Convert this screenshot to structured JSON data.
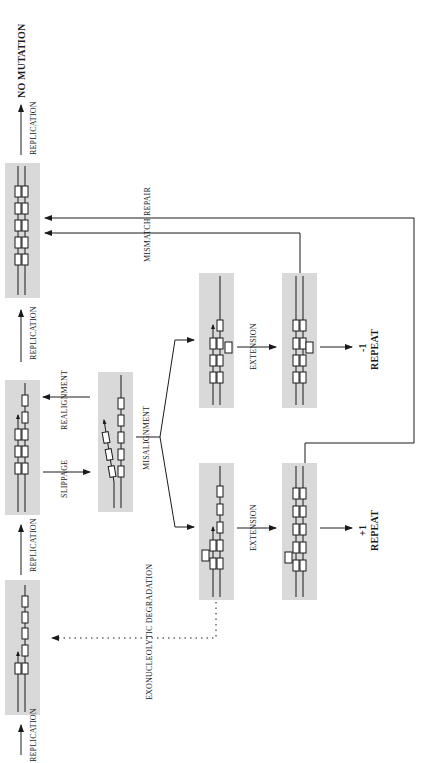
{
  "diagram": {
    "orientation": "rotated-90-ccw",
    "colors": {
      "panel_bg": "#d9d9d9",
      "line": "#1a1a1a",
      "box_fill": "#ffffff"
    },
    "labels": {
      "replication_1": "REPLICATION",
      "replication_2": "REPLICATION",
      "replication_3": "REPLICATION",
      "replication_4": "REPLICATION",
      "slippage": "SLIPPAGE",
      "realignment": "REALIGNMENT",
      "misalignment": "MISALIGNMENT",
      "mismatch_repair": "MISMATCH REPAIR",
      "extension_plus": "EXTENSION",
      "extension_minus": "EXTENSION",
      "exonucleolytic": "EXONUCLEOLYTIC DEGRADATION",
      "no_mutation": "NO MUTATION",
      "plus_one_num": "+1",
      "plus_one_word": "REPEAT",
      "minus_one_num": "-1",
      "minus_one_word": "REPEAT"
    },
    "panels": [
      {
        "id": "initial-strand",
        "state": "primer on template, 2 paired repeats"
      },
      {
        "id": "replicating",
        "state": "3 paired repeats"
      },
      {
        "id": "slipped",
        "state": "nascent strand slipped"
      },
      {
        "id": "complete-normal",
        "state": "5 paired repeats"
      },
      {
        "id": "misaligned-plus",
        "state": "loop on nascent strand"
      },
      {
        "id": "extended-plus",
        "state": "extra repeat, loop"
      },
      {
        "id": "misaligned-minus",
        "state": "loop on template strand"
      },
      {
        "id": "extended-minus",
        "state": "missing repeat, loop"
      }
    ]
  }
}
